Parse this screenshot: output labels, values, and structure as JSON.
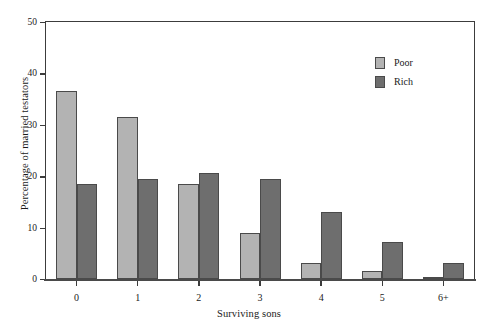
{
  "chart_data": {
    "type": "bar",
    "title": "",
    "subtitle": "",
    "xlabel": "Surviving sons",
    "ylabel": "Percentage of married testators",
    "categories": [
      "0",
      "1",
      "2",
      "3",
      "4",
      "5",
      "6+"
    ],
    "series": [
      {
        "name": "Poor",
        "color": "#b3b3b3",
        "values": [
          36.5,
          31.6,
          18.5,
          9.0,
          3.2,
          1.5,
          0.4
        ]
      },
      {
        "name": "Rich",
        "color": "#6e6e6e",
        "values": [
          18.4,
          19.5,
          20.6,
          19.5,
          13.0,
          7.2,
          3.1
        ]
      }
    ],
    "ylim": [
      0,
      50
    ],
    "yticks": [
      0,
      10,
      20,
      30,
      40,
      50
    ],
    "ytick_labels": [
      "0",
      "10",
      "20",
      "30",
      "40",
      "50"
    ],
    "grid": false,
    "legend_position": "top-right",
    "legend_entries": [
      "Poor",
      "Rich"
    ],
    "axis_color": "#3c3c3c",
    "bar_edge_color": "#4a4a4a",
    "background": "#ffffff"
  }
}
